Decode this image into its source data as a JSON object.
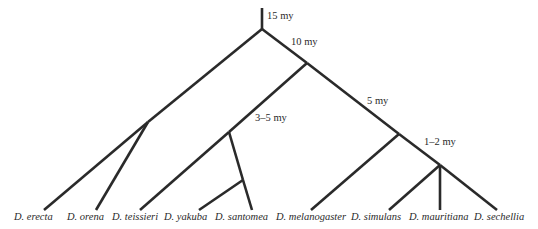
{
  "diagram": {
    "type": "phylogenetic-tree",
    "line_color": "#2a2a2a",
    "time_labels": [
      {
        "text": "15 my",
        "x": 267,
        "y": 12
      },
      {
        "text": "10 my",
        "x": 291,
        "y": 36
      },
      {
        "text": "5 my",
        "x": 367,
        "y": 95
      },
      {
        "text": "3–5 my",
        "x": 255,
        "y": 112
      },
      {
        "text": "1–2 my",
        "x": 424,
        "y": 136
      }
    ],
    "taxa": [
      {
        "name": "D. erecta",
        "x": 14
      },
      {
        "name": "D. orena",
        "x": 67
      },
      {
        "name": "D. teissieri",
        "x": 112
      },
      {
        "name": "D. yakuba",
        "x": 164
      },
      {
        "name": "D. santomea",
        "x": 215
      },
      {
        "name": "D. melanogaster",
        "x": 276
      },
      {
        "name": "D. simulans",
        "x": 351
      },
      {
        "name": "D. mauritiana",
        "x": 409
      },
      {
        "name": "D. sechellia",
        "x": 474
      }
    ]
  }
}
